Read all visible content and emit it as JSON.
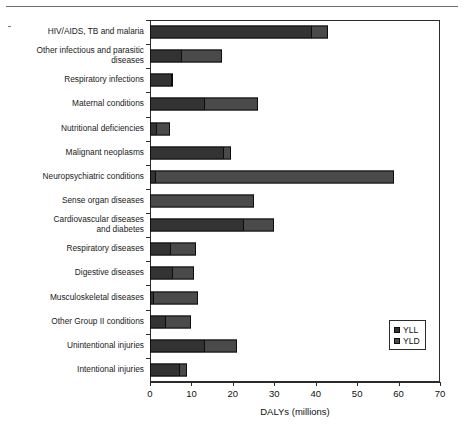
{
  "chart_data": {
    "type": "bar",
    "orientation": "horizontal",
    "stacked": true,
    "title": "",
    "xlabel": "DALYs (millions)",
    "ylabel": "",
    "xlim": [
      0,
      70
    ],
    "xticks": [
      0,
      10,
      20,
      30,
      40,
      50,
      60,
      70
    ],
    "xtick_labels": [
      "0",
      "10",
      "20",
      "30",
      "40",
      "50",
      "60",
      "70"
    ],
    "grid": false,
    "legend_position": "right-lower",
    "legend": [
      "YLL",
      "YLD"
    ],
    "colors": {
      "YLL": "#333333",
      "YLD": "#4a4a4a",
      "axis": "#2b2b2b",
      "background": "#ffffff"
    },
    "categories": [
      "HIV/AIDS, TB and malaria",
      "Other infectious and parasitic\ndiseases",
      "Respiratory infections",
      "Maternal conditions",
      "Nutritional deficiencies",
      "Malignant neoplasms",
      "Neuropsychiatric conditions",
      "Sense organ diseases",
      "Cardiovascular diseases\nand diabetes",
      "Respiratory diseases",
      "Digestive diseases",
      "Musculoskeletal diseases",
      "Other Group II conditions",
      "Unintentional injuries",
      "Intentional injuries"
    ],
    "series": [
      {
        "name": "YLL",
        "values": [
          38.9,
          7.5,
          5.0,
          13.0,
          1.5,
          17.5,
          1.2,
          0.0,
          22.5,
          4.9,
          5.3,
          0.7,
          3.6,
          13.0,
          7.0
        ]
      },
      {
        "name": "YLD",
        "values": [
          4.1,
          9.9,
          0.1,
          13.0,
          3.3,
          2.0,
          57.8,
          25.0,
          7.5,
          6.1,
          5.3,
          10.8,
          6.4,
          8.0,
          2.0
        ]
      }
    ],
    "totals": [
      43.0,
      17.4,
      5.1,
      26.0,
      4.8,
      19.5,
      59.0,
      25.0,
      30.0,
      11.0,
      10.6,
      11.5,
      10.0,
      21.0,
      9.0
    ]
  }
}
